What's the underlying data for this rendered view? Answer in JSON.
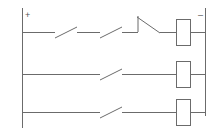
{
  "diagram": {
    "type": "electrical-ladder-diagram",
    "canvas": {
      "width": 223,
      "height": 135
    },
    "colors": {
      "line": "#6b6b6b",
      "background": "#ffffff",
      "text": "#555555"
    },
    "rails": {
      "left": {
        "label": "+",
        "name": "positive-supply-rail",
        "x": 22,
        "y_top": 8,
        "y_bottom": 128
      },
      "right": {
        "label": "–",
        "name": "negative-supply-rail",
        "x": 205,
        "y_top": 8,
        "y_bottom": 116
      }
    },
    "rungs": [
      {
        "name": "rung-1",
        "y": 32,
        "contacts": [
          {
            "name": "contact-1-1",
            "type": "normally-open",
            "x": 55,
            "width": 22
          },
          {
            "name": "contact-1-2",
            "type": "normally-open",
            "x": 100,
            "width": 22
          },
          {
            "name": "contact-1-3",
            "type": "normally-closed",
            "x": 138,
            "width": 22
          }
        ],
        "coil": {
          "name": "coil-1",
          "x": 176,
          "width": 14,
          "height": 26
        }
      },
      {
        "name": "rung-2",
        "y": 74,
        "contacts": [
          {
            "name": "contact-2-1",
            "type": "normally-open",
            "x": 100,
            "width": 22
          }
        ],
        "coil": {
          "name": "coil-2",
          "x": 176,
          "width": 14,
          "height": 26
        }
      },
      {
        "name": "rung-3",
        "y": 112,
        "contacts": [
          {
            "name": "contact-3-1",
            "type": "normally-open",
            "x": 100,
            "width": 22
          }
        ],
        "coil": {
          "name": "coil-3",
          "x": 176,
          "width": 14,
          "height": 26
        }
      }
    ]
  }
}
